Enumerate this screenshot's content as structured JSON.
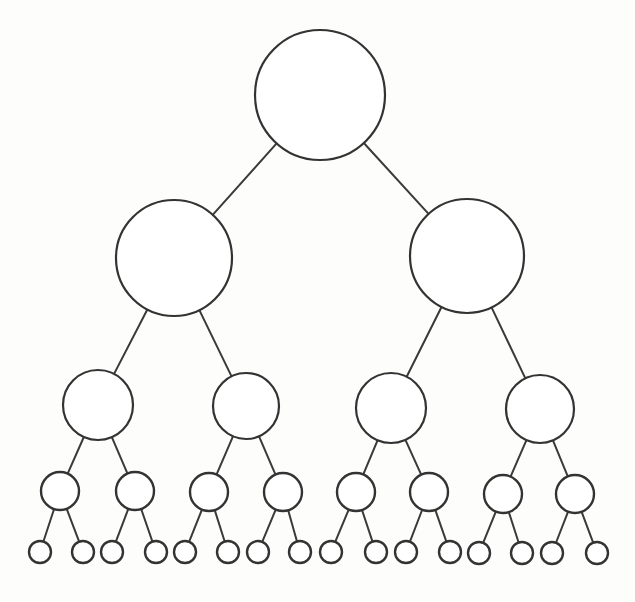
{
  "diagram": {
    "type": "binary-tree",
    "background_color": "#fdfdfc",
    "stroke_color": "#333333",
    "node_fill_color": "#ffffff",
    "edge_color": "#3a3a3a",
    "stroke_width": 2,
    "depth": 5,
    "branching_factor": 2,
    "total_nodes": 31,
    "nodes_per_level": [
      1,
      2,
      4,
      8,
      16
    ],
    "canvas": {
      "width": 635,
      "height": 602
    }
  },
  "chart_data": {
    "type": "diagram",
    "levels": [
      {
        "level": 0,
        "name": "root",
        "radius": 65,
        "count": 1,
        "nodes": [
          {
            "id": "n0",
            "cx": 320,
            "cy": 95,
            "r": 65,
            "parent": null
          }
        ]
      },
      {
        "level": 1,
        "name": "level-1",
        "radius": 58,
        "count": 2,
        "nodes": [
          {
            "id": "n1",
            "cx": 174,
            "cy": 258,
            "r": 58,
            "parent": "n0"
          },
          {
            "id": "n2",
            "cx": 467,
            "cy": 256,
            "r": 57,
            "parent": "n0"
          }
        ]
      },
      {
        "level": 2,
        "name": "level-2",
        "radius": 35,
        "count": 4,
        "nodes": [
          {
            "id": "n3",
            "cx": 98,
            "cy": 405,
            "r": 35,
            "parent": "n1"
          },
          {
            "id": "n4",
            "cx": 246,
            "cy": 406,
            "r": 33,
            "parent": "n1"
          },
          {
            "id": "n5",
            "cx": 391,
            "cy": 408,
            "r": 35,
            "parent": "n2"
          },
          {
            "id": "n6",
            "cx": 540,
            "cy": 409,
            "r": 34,
            "parent": "n2"
          }
        ]
      },
      {
        "level": 3,
        "name": "level-3",
        "radius": 19,
        "count": 8,
        "nodes": [
          {
            "id": "n7",
            "cx": 60,
            "cy": 491,
            "r": 19,
            "parent": "n3"
          },
          {
            "id": "n8",
            "cx": 135,
            "cy": 491,
            "r": 19,
            "parent": "n3"
          },
          {
            "id": "n9",
            "cx": 209,
            "cy": 492,
            "r": 19,
            "parent": "n4"
          },
          {
            "id": "n10",
            "cx": 283,
            "cy": 492,
            "r": 19,
            "parent": "n4"
          },
          {
            "id": "n11",
            "cx": 356,
            "cy": 492,
            "r": 19,
            "parent": "n5"
          },
          {
            "id": "n12",
            "cx": 429,
            "cy": 492,
            "r": 19,
            "parent": "n5"
          },
          {
            "id": "n13",
            "cx": 503,
            "cy": 494,
            "r": 19,
            "parent": "n6"
          },
          {
            "id": "n14",
            "cx": 575,
            "cy": 494,
            "r": 19,
            "parent": "n6"
          }
        ]
      },
      {
        "level": 4,
        "name": "leaves",
        "radius": 11,
        "count": 16,
        "nodes": [
          {
            "id": "n15",
            "cx": 40,
            "cy": 552,
            "r": 11,
            "parent": "n7"
          },
          {
            "id": "n16",
            "cx": 83,
            "cy": 552,
            "r": 11,
            "parent": "n7"
          },
          {
            "id": "n17",
            "cx": 112,
            "cy": 552,
            "r": 11,
            "parent": "n8"
          },
          {
            "id": "n18",
            "cx": 156,
            "cy": 552,
            "r": 11,
            "parent": "n8"
          },
          {
            "id": "n19",
            "cx": 185,
            "cy": 552,
            "r": 11,
            "parent": "n9"
          },
          {
            "id": "n20",
            "cx": 228,
            "cy": 552,
            "r": 11,
            "parent": "n9"
          },
          {
            "id": "n21",
            "cx": 258,
            "cy": 552,
            "r": 11,
            "parent": "n10"
          },
          {
            "id": "n22",
            "cx": 300,
            "cy": 552,
            "r": 11,
            "parent": "n10"
          },
          {
            "id": "n23",
            "cx": 331,
            "cy": 552,
            "r": 11,
            "parent": "n11"
          },
          {
            "id": "n24",
            "cx": 376,
            "cy": 552,
            "r": 11,
            "parent": "n11"
          },
          {
            "id": "n25",
            "cx": 406,
            "cy": 552,
            "r": 11,
            "parent": "n12"
          },
          {
            "id": "n26",
            "cx": 450,
            "cy": 552,
            "r": 11,
            "parent": "n12"
          },
          {
            "id": "n27",
            "cx": 479,
            "cy": 553,
            "r": 11,
            "parent": "n13"
          },
          {
            "id": "n28",
            "cx": 522,
            "cy": 553,
            "r": 11,
            "parent": "n13"
          },
          {
            "id": "n29",
            "cx": 552,
            "cy": 553,
            "r": 11,
            "parent": "n14"
          },
          {
            "id": "n30",
            "cx": 597,
            "cy": 553,
            "r": 11,
            "parent": "n14"
          }
        ]
      }
    ]
  }
}
